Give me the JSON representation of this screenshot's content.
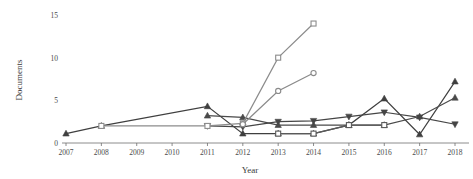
{
  "chart_data": {
    "type": "line",
    "title": "",
    "xlabel": "Year",
    "ylabel": "Documents",
    "categories": [
      "2007",
      "2008",
      "2009",
      "2010",
      "2011",
      "2012",
      "2013",
      "2014",
      "2015",
      "2016",
      "2017",
      "2018"
    ],
    "yticks": [
      0,
      5,
      10,
      15
    ],
    "ylim": [
      0,
      15
    ],
    "grid": false,
    "legend": "none",
    "series": [
      {
        "name": "Series 1",
        "marker": "triangle-up",
        "color": "#3f3f3f",
        "x": [
          "2007",
          "2008",
          "2011",
          "2012",
          "2013",
          "2014",
          "2015",
          "2016",
          "2017",
          "2018"
        ],
        "values": [
          1.1,
          2.0,
          4.3,
          1.1,
          1.1,
          1.1,
          2.1,
          5.2,
          1.0,
          7.2
        ]
      },
      {
        "name": "Series 2",
        "marker": "triangle-up",
        "color": "#4a4a4a",
        "x": [
          "2011",
          "2012",
          "2013",
          "2014",
          "2015",
          "2016",
          "2017",
          "2018"
        ],
        "values": [
          3.2,
          3.0,
          2.1,
          2.1,
          2.1,
          2.1,
          3.1,
          5.3
        ]
      },
      {
        "name": "Series 3",
        "marker": "triangle-down",
        "color": "#454545",
        "x": [
          "2011",
          "2012",
          "2013",
          "2014",
          "2015",
          "2016",
          "2017",
          "2018"
        ],
        "values": [
          2.0,
          1.9,
          2.5,
          2.6,
          3.1,
          3.6,
          3.0,
          2.2
        ]
      },
      {
        "name": "Series 4",
        "marker": "square",
        "color": "#8c8c8c",
        "x": [
          "2008",
          "2011",
          "2012",
          "2013",
          "2014"
        ],
        "values": [
          2.0,
          2.0,
          2.3,
          10.0,
          14.0
        ]
      },
      {
        "name": "Series 5",
        "marker": "circle",
        "color": "#8a8a8a",
        "x": [
          "2012",
          "2013",
          "2014"
        ],
        "values": [
          2.2,
          6.1,
          8.2
        ]
      },
      {
        "name": "Series 6",
        "marker": "square",
        "color": "#5a5a5a",
        "x": [
          "2013",
          "2014",
          "2015",
          "2016"
        ],
        "values": [
          1.1,
          1.1,
          2.1,
          2.1
        ]
      }
    ]
  },
  "axes": {
    "ylabel": "Documents",
    "xlabel": "Year",
    "ytick_labels": [
      "0",
      "5",
      "10",
      "15"
    ],
    "xtick_labels": [
      "2007",
      "2008",
      "2009",
      "2010",
      "2011",
      "2012",
      "2013",
      "2014",
      "2015",
      "2016",
      "2017",
      "2018"
    ]
  }
}
